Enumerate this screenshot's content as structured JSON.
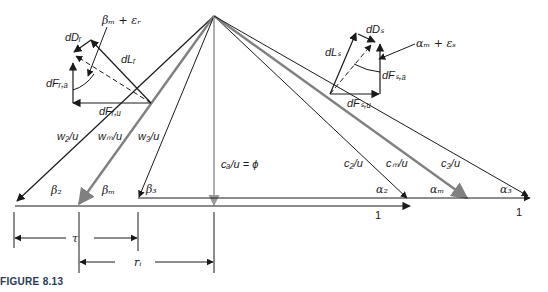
{
  "figure": {
    "caption": "FIGURE 8.13",
    "colors": {
      "line": "#1a1a1a",
      "mean_line": "#808080",
      "axial_line": "#9a9a9a",
      "caption": "#2a3a55"
    },
    "velocity_labels": {
      "w2": "w₂/u",
      "wm": "wₘ/u",
      "w3": "w₃/u",
      "ca": "cₐ/u = ϕ",
      "c2": "c₂/u",
      "cm": "cₘ/u",
      "c3": "c₃/u"
    },
    "angle_labels": {
      "beta2": "β₂",
      "betam": "βₘ",
      "beta3": "β₃",
      "alpha2": "α₂",
      "alpham": "αₘ",
      "alpha3": "α₃"
    },
    "unit_labels": {
      "rotor_one": "1",
      "stator_one": "1"
    },
    "dimension_labels": {
      "tau": "τ",
      "ri": "rᵢ"
    },
    "rotor_forces": {
      "dD": "dDᵣ",
      "dL": "dLᵣ",
      "dFa": "dFᵣ,ₐ",
      "dFu": "dFᵣ,ᵤ",
      "angle": "βₘ + εᵣ"
    },
    "stator_forces": {
      "dD": "dDₛ",
      "dL": "dLₛ",
      "dFa": "dFₛ,ₐ",
      "dFu": "dFₛ,ᵤ",
      "angle": "αₘ + εₛ"
    }
  }
}
